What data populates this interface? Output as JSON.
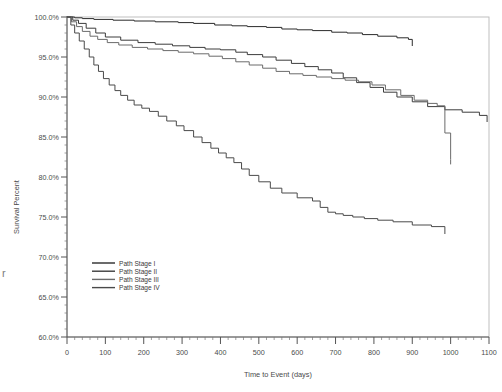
{
  "chart_data": {
    "type": "line",
    "title": "",
    "xlabel": "Time to Event (days)",
    "ylabel": "Survival Percent",
    "xlim": [
      0,
      1100
    ],
    "ylim": [
      60,
      100
    ],
    "xticks": [
      0,
      100,
      200,
      300,
      400,
      500,
      600,
      700,
      800,
      900,
      1000,
      1100
    ],
    "xtick_labels": [
      "0",
      "100",
      "200",
      "300",
      "400",
      "500",
      "600",
      "700",
      "800",
      "900",
      "1000",
      "1100"
    ],
    "yticks": [
      60,
      65,
      70,
      75,
      80,
      85,
      90,
      95,
      100
    ],
    "ytick_labels": [
      "60.0%",
      "65.0%",
      "70.0%",
      "75.0%",
      "80.0%",
      "85.0%",
      "90.0%",
      "95.0%",
      "100.0%"
    ],
    "grid": false,
    "legend_position": "lower-left",
    "minor_ticks": true,
    "series": [
      {
        "name": "Path Stage I",
        "color": "#2b2b2b",
        "x": [
          0,
          20,
          40,
          70,
          120,
          175,
          230,
          290,
          330,
          385,
          430,
          470,
          520,
          560,
          600,
          640,
          690,
          730,
          770,
          810,
          860,
          890,
          900
        ],
        "y": [
          100.0,
          99.9,
          99.8,
          99.7,
          99.6,
          99.5,
          99.4,
          99.3,
          99.2,
          99.0,
          98.9,
          98.8,
          98.7,
          98.5,
          98.4,
          98.3,
          98.1,
          98.0,
          97.8,
          97.6,
          97.4,
          97.2,
          97.0
        ]
      },
      {
        "name": "Path Stage II",
        "color": "#3c3c3c",
        "x": [
          0,
          15,
          30,
          50,
          75,
          100,
          140,
          185,
          230,
          275,
          320,
          360,
          400,
          440,
          470,
          510,
          545,
          585,
          620,
          655,
          690,
          720,
          755,
          790,
          825,
          860,
          900,
          940,
          985,
          1030,
          1075,
          1095
        ],
        "y": [
          100.0,
          99.6,
          99.2,
          98.6,
          98.0,
          97.5,
          97.1,
          96.8,
          96.6,
          96.4,
          96.2,
          96.0,
          95.9,
          95.6,
          95.3,
          95.0,
          94.6,
          94.2,
          93.8,
          93.4,
          93.0,
          92.4,
          91.8,
          91.2,
          90.6,
          90.0,
          89.4,
          88.8,
          88.4,
          88.1,
          87.7,
          87.5
        ]
      },
      {
        "name": "Path Stage III",
        "color": "#6b6b6b",
        "x": [
          0,
          12,
          25,
          40,
          60,
          80,
          105,
          135,
          170,
          210,
          250,
          290,
          330,
          370,
          405,
          440,
          475,
          510,
          545,
          580,
          615,
          650,
          690,
          725,
          760,
          795,
          830,
          870,
          905,
          940,
          965,
          985,
          1000
        ],
        "y": [
          100.0,
          99.4,
          98.8,
          98.2,
          97.6,
          97.2,
          96.8,
          96.5,
          96.2,
          96.0,
          95.8,
          95.6,
          95.4,
          95.1,
          94.8,
          94.4,
          94.0,
          93.6,
          93.2,
          92.9,
          92.7,
          92.5,
          92.3,
          92.1,
          91.9,
          91.5,
          90.9,
          90.2,
          89.6,
          89.2,
          88.9,
          85.5,
          82.2
        ]
      },
      {
        "name": "Path Stage IV",
        "color": "#4a4a4a",
        "x": [
          0,
          10,
          20,
          32,
          45,
          58,
          70,
          82,
          95,
          110,
          125,
          140,
          158,
          175,
          195,
          215,
          238,
          260,
          285,
          305,
          330,
          352,
          375,
          395,
          415,
          435,
          455,
          475,
          500,
          530,
          560,
          600,
          640,
          660,
          680,
          700,
          720,
          745,
          775,
          810,
          850,
          900,
          950,
          985
        ],
        "y": [
          100.0,
          99.0,
          98.0,
          97.0,
          96.0,
          95.0,
          94.0,
          93.2,
          92.3,
          91.5,
          90.8,
          90.2,
          89.6,
          89.0,
          88.6,
          88.2,
          87.6,
          87.0,
          86.4,
          85.8,
          85.0,
          84.3,
          83.6,
          83.0,
          82.4,
          81.8,
          81.0,
          80.2,
          79.4,
          78.6,
          78.0,
          77.4,
          77.0,
          76.2,
          75.6,
          75.4,
          75.2,
          75.0,
          74.8,
          74.6,
          74.4,
          74.0,
          73.8,
          73.5
        ]
      }
    ]
  },
  "legend": {
    "items": [
      {
        "label": "Path Stage I"
      },
      {
        "label": "Path Stage II"
      },
      {
        "label": "Path Stage III"
      },
      {
        "label": "Path Stage IV"
      }
    ]
  },
  "artifacts": {
    "stray_char": "r"
  }
}
